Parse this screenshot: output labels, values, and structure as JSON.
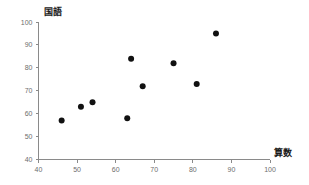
{
  "chart_data": {
    "type": "scatter",
    "title": "",
    "xlabel": "算数",
    "ylabel": "国語",
    "xlim": [
      40,
      100
    ],
    "ylim": [
      40,
      100
    ],
    "xticks": [
      40,
      50,
      60,
      70,
      80,
      90,
      100
    ],
    "yticks": [
      40,
      50,
      60,
      70,
      80,
      90,
      100
    ],
    "grid": false,
    "legend": null,
    "marker": {
      "shape": "circle",
      "color": "#111111",
      "size_px": 4
    },
    "series": [
      {
        "name": "students",
        "points": [
          {
            "x": 46,
            "y": 57
          },
          {
            "x": 51,
            "y": 63
          },
          {
            "x": 54,
            "y": 65
          },
          {
            "x": 63,
            "y": 58
          },
          {
            "x": 64,
            "y": 84
          },
          {
            "x": 67,
            "y": 72
          },
          {
            "x": 75,
            "y": 82
          },
          {
            "x": 81,
            "y": 73
          },
          {
            "x": 86,
            "y": 95
          }
        ]
      }
    ]
  },
  "axes": {
    "y_title": "国語",
    "x_title": "算数",
    "x_tick_labels": [
      "40",
      "50",
      "60",
      "70",
      "80",
      "90",
      "100"
    ],
    "y_tick_labels": [
      "100",
      "90",
      "80",
      "70",
      "60",
      "50",
      "40"
    ]
  },
  "colors": {
    "axis": "#8a8a8a",
    "tick_text": "#6d6d6d",
    "title_text": "#1a1a1a",
    "marker": "#111111",
    "background": "#ffffff"
  }
}
